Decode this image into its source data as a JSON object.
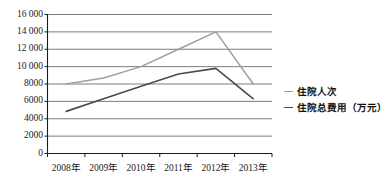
{
  "chart_data": {
    "type": "line",
    "title": "",
    "xlabel": "",
    "ylabel": "",
    "categories": [
      "2008年",
      "2009年",
      "2010年",
      "2011年",
      "2012年",
      "2013年"
    ],
    "ylim": [
      0,
      16000
    ],
    "ytick_step": 2000,
    "ytick_labels": [
      "0",
      "2000",
      "4000",
      "6000",
      "8000",
      "10 000",
      "12 000",
      "14 000",
      "16 000"
    ],
    "ytick_values": [
      0,
      2000,
      4000,
      6000,
      8000,
      10000,
      12000,
      14000,
      16000
    ],
    "grid": true,
    "grid_axis": "y",
    "legend_position": "right",
    "series": [
      {
        "name": "住院人次",
        "color": "#9e9e9e",
        "values": [
          8000,
          8700,
          10000,
          12000,
          14000,
          8000
        ]
      },
      {
        "name": "住院总费用（万元）",
        "color": "#4a4a4a",
        "values": [
          4850,
          6300,
          7750,
          9150,
          9800,
          6300
        ]
      }
    ]
  },
  "legend": {
    "items": [
      {
        "label": "住院人次",
        "color": "#9e9e9e"
      },
      {
        "label": "住院总费用（万元）",
        "color": "#4a4a4a"
      }
    ]
  },
  "colors": {
    "axis": "#1a1a1a",
    "grid": "#6e6e6e",
    "series_light": "#9e9e9e",
    "series_dark": "#4a4a4a",
    "background": "#ffffff"
  }
}
